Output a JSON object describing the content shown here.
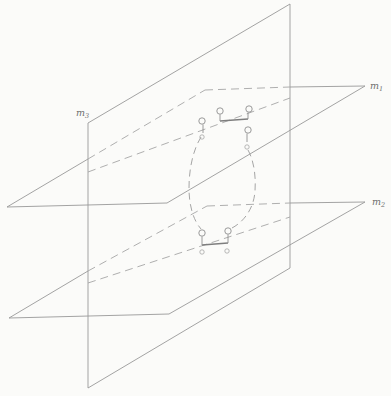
{
  "figure": {
    "background": "#fbfbf9",
    "solid_color": "#989898",
    "hidden_color": "#a6a6a6",
    "curve_color": "#9b9b9b",
    "marker_color": "#8e8e8e",
    "connector_color": "#7e7e7e",
    "label_color": "#6f6f6f",
    "labels": [
      {
        "name": "label-m3",
        "text": "m",
        "sub": "3",
        "x": 76,
        "y": 116
      },
      {
        "name": "label-m1",
        "text": "m",
        "sub": "1",
        "x": 370,
        "y": 89
      },
      {
        "name": "label-m2",
        "text": "m",
        "sub": "2",
        "x": 372,
        "y": 205
      }
    ],
    "solid_segments": [
      {
        "name": "plane-m3-left-edge",
        "x1": 88,
        "y1": 123,
        "x2": 88,
        "y2": 388
      },
      {
        "name": "plane-m3-top-edge",
        "x1": 88,
        "y1": 123,
        "x2": 290,
        "y2": 4
      },
      {
        "name": "plane-m3-right-edge",
        "x1": 290,
        "y1": 4,
        "x2": 290,
        "y2": 268
      },
      {
        "name": "plane-m3-bottom-edge",
        "x1": 88,
        "y1": 388,
        "x2": 290,
        "y2": 268
      },
      {
        "name": "plane-m1-front-edge",
        "x1": 7,
        "y1": 207,
        "x2": 167,
        "y2": 203
      },
      {
        "name": "plane-m1-right-edge",
        "x1": 167,
        "y1": 203,
        "x2": 365,
        "y2": 86
      },
      {
        "name": "plane-m1-back-edge-visible",
        "x1": 290,
        "y1": 87,
        "x2": 365,
        "y2": 86
      },
      {
        "name": "plane-m1-left-edge-visible",
        "x1": 7,
        "y1": 207,
        "x2": 88,
        "y2": 159
      },
      {
        "name": "plane-m2-front-edge",
        "x1": 9,
        "y1": 318,
        "x2": 169,
        "y2": 314
      },
      {
        "name": "plane-m2-right-edge",
        "x1": 169,
        "y1": 314,
        "x2": 365,
        "y2": 202
      },
      {
        "name": "plane-m2-back-edge-visible",
        "x1": 290,
        "y1": 203,
        "x2": 365,
        "y2": 202
      },
      {
        "name": "plane-m2-left-edge-visible",
        "x1": 9,
        "y1": 318,
        "x2": 88,
        "y2": 271
      }
    ],
    "dashed_segments": [
      {
        "name": "plane-m1-back-edge-hidden",
        "x1": 205,
        "y1": 90,
        "x2": 290,
        "y2": 87
      },
      {
        "name": "plane-m1-left-edge-hidden",
        "x1": 88,
        "y1": 159,
        "x2": 205,
        "y2": 90
      },
      {
        "name": "plane-m1-trace-line",
        "x1": 88,
        "y1": 172,
        "x2": 290,
        "y2": 98
      },
      {
        "name": "plane-m2-back-edge-hidden",
        "x1": 207,
        "y1": 206,
        "x2": 290,
        "y2": 203
      },
      {
        "name": "plane-m2-left-edge-hidden",
        "x1": 88,
        "y1": 271,
        "x2": 207,
        "y2": 206
      },
      {
        "name": "plane-m2-trace-line",
        "x1": 88,
        "y1": 283,
        "x2": 290,
        "y2": 217
      }
    ],
    "curve_strands": [
      {
        "name": "curve-left-strand",
        "d": "M 201 137 C 193 150 189 169 189 188 C 189 207 194 221 201 229"
      },
      {
        "name": "curve-right-strand",
        "d": "M 248 150 C 254 161 256 176 255 191 C 254 207 245 222 230 229"
      }
    ],
    "connectors": [
      {
        "name": "top-connector-segment",
        "x1": 220,
        "y1": 121,
        "x2": 248,
        "y2": 119
      },
      {
        "name": "bottom-connector-segment",
        "x1": 202,
        "y1": 245,
        "x2": 228,
        "y2": 243
      }
    ],
    "loop_markers": [
      {
        "name": "loop-marker-top-a",
        "cx": 202,
        "cy": 121,
        "r": 3.2,
        "tx1": 203,
        "ty1": 124.5,
        "tx2": 203,
        "ty2": 133
      },
      {
        "name": "loop-marker-top-b",
        "cx": 220,
        "cy": 111,
        "r": 3.2,
        "tx1": 220,
        "ty1": 114.5,
        "tx2": 220,
        "ty2": 121
      },
      {
        "name": "loop-marker-top-c",
        "cx": 249,
        "cy": 109,
        "r": 3.2,
        "tx1": 248,
        "ty1": 112.5,
        "tx2": 248,
        "ty2": 119
      },
      {
        "name": "loop-marker-top-d",
        "cx": 248,
        "cy": 130,
        "r": 3.2,
        "tx1": 247,
        "ty1": 133.5,
        "tx2": 247,
        "ty2": 142
      },
      {
        "name": "loop-marker-bottom-e",
        "cx": 202,
        "cy": 233,
        "r": 3.2,
        "tx1": 202,
        "ty1": 236.5,
        "tx2": 202,
        "ty2": 245
      },
      {
        "name": "loop-marker-bottom-f",
        "cx": 228,
        "cy": 231,
        "r": 3.2,
        "tx1": 228,
        "ty1": 234.5,
        "tx2": 228,
        "ty2": 243
      }
    ],
    "point_markers": [
      {
        "name": "point-marker-top-a",
        "cx": 202,
        "cy": 137,
        "r": 2.2
      },
      {
        "name": "point-marker-top-d",
        "cx": 247,
        "cy": 147,
        "r": 2.2
      },
      {
        "name": "point-marker-bottom-e",
        "cx": 202,
        "cy": 252,
        "r": 2.2
      },
      {
        "name": "point-marker-bottom-f",
        "cx": 227,
        "cy": 251,
        "r": 2.2
      }
    ]
  }
}
